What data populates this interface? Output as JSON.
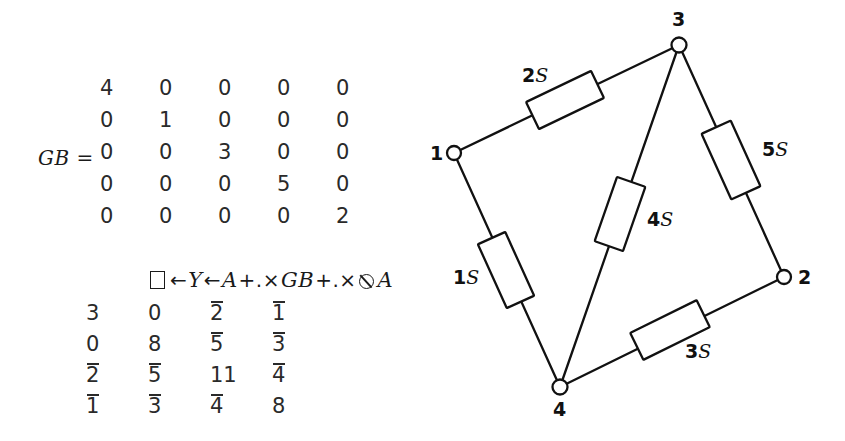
{
  "figure": {
    "background_color": "#ffffff",
    "ink_color": "#1a1a1a"
  },
  "algebra": {
    "gb": {
      "name": "GB",
      "assign_label": "GB =",
      "rows": [
        [
          "4",
          "0",
          "0",
          "0",
          "0"
        ],
        [
          "0",
          "1",
          "0",
          "0",
          "0"
        ],
        [
          "0",
          "0",
          "3",
          "0",
          "0"
        ],
        [
          "0",
          "0",
          "0",
          "5",
          "0"
        ],
        [
          "0",
          "0",
          "0",
          "0",
          "2"
        ]
      ]
    },
    "expression": {
      "quad": "□",
      "assign1": "←",
      "var_y": "Y",
      "assign2": "←",
      "var_a1": "A",
      "inner_product1": "+.×",
      "var_gb": "GB",
      "inner_product2": "+.×",
      "transpose": "⍉",
      "var_a2": "A",
      "full_text": "□ ←Y ←A +.×GB +.×⍉A"
    },
    "y": {
      "name": "Y",
      "rows": [
        [
          {
            "neg": false,
            "mag": "3"
          },
          {
            "neg": false,
            "mag": "0"
          },
          {
            "neg": true,
            "mag": "2"
          },
          {
            "neg": true,
            "mag": "1"
          }
        ],
        [
          {
            "neg": false,
            "mag": "0"
          },
          {
            "neg": false,
            "mag": "8"
          },
          {
            "neg": true,
            "mag": "5"
          },
          {
            "neg": true,
            "mag": "3"
          }
        ],
        [
          {
            "neg": true,
            "mag": "2"
          },
          {
            "neg": true,
            "mag": "5"
          },
          {
            "neg": false,
            "mag": "11"
          },
          {
            "neg": true,
            "mag": "4"
          }
        ],
        [
          {
            "neg": true,
            "mag": "1"
          },
          {
            "neg": true,
            "mag": "3"
          },
          {
            "neg": true,
            "mag": "4"
          },
          {
            "neg": false,
            "mag": "8"
          }
        ]
      ]
    }
  },
  "circuit": {
    "title": "resistive network",
    "nodes": [
      {
        "id": "1",
        "label": "1",
        "cx": 34,
        "cy": 153,
        "label_x": 10,
        "label_y": 142
      },
      {
        "id": "2",
        "label": "2",
        "cx": 364,
        "cy": 277,
        "label_x": 378,
        "label_y": 266
      },
      {
        "id": "3",
        "label": "3",
        "cx": 259,
        "cy": 45,
        "label_x": 252,
        "label_y": 8
      },
      {
        "id": "4",
        "label": "4",
        "cx": 140,
        "cy": 387,
        "label_x": 133,
        "label_y": 398
      }
    ],
    "branches": [
      {
        "id": "b2",
        "value": "2",
        "unit": "S",
        "label": "2S",
        "from": "1",
        "to": "3",
        "label_x": 102,
        "label_y": 64
      },
      {
        "id": "b5",
        "value": "5",
        "unit": "S",
        "label": "5S",
        "from": "3",
        "to": "2",
        "label_x": 342,
        "label_y": 138
      },
      {
        "id": "b4",
        "value": "4",
        "unit": "S",
        "label": "4S",
        "from": "3",
        "to": "4",
        "label_x": 227,
        "label_y": 208
      },
      {
        "id": "b1",
        "value": "1",
        "unit": "S",
        "label": "1S",
        "from": "1",
        "to": "4",
        "label_x": 33,
        "label_y": 266
      },
      {
        "id": "b3",
        "value": "3",
        "unit": "S",
        "label": "3S",
        "from": "4",
        "to": "2",
        "label_x": 265,
        "label_y": 340
      }
    ]
  }
}
